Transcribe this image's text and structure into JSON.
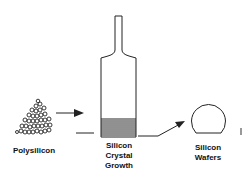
{
  "diagram": {
    "stages": [
      {
        "id": "polysilicon",
        "lines": [
          "Polysilicon"
        ]
      },
      {
        "id": "crystal",
        "lines": [
          "Silicon",
          "Crystal",
          "Growth"
        ]
      },
      {
        "id": "wafers",
        "lines": [
          "Silicon",
          "Wafers"
        ]
      }
    ],
    "arrows": [
      {
        "from": "polysilicon",
        "to": "crystal"
      },
      {
        "from": "crystal",
        "to": "wafers"
      }
    ],
    "colors": {
      "ink": "#222222",
      "background": "#ffffff"
    }
  }
}
